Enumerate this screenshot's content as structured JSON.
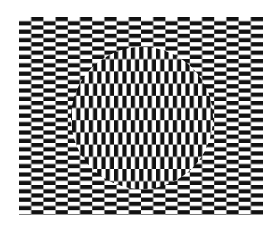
{
  "figure": {
    "type": "ouchi-illusion",
    "background": "#ffffff",
    "foreground": "#111111",
    "outer_field": {
      "x": 19,
      "y": 17,
      "width": 244,
      "height": 198,
      "brick_width": 12.2,
      "brick_height": 4.2,
      "orientation": "horizontal"
    },
    "inner_disc": {
      "cx": 142,
      "cy": 118,
      "r": 71,
      "brick_width": 4.2,
      "brick_height": 12.2,
      "orientation": "vertical"
    }
  }
}
